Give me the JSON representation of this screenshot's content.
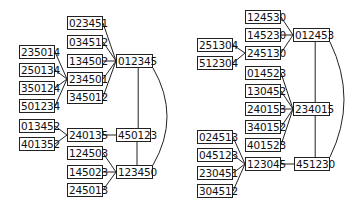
{
  "graphs": [
    {
      "name": "left-graph",
      "nodes": [
        {
          "id": "023451",
          "x": 67,
          "y": 16,
          "w": 36
        },
        {
          "id": "034512",
          "x": 67,
          "y": 35,
          "w": 36
        },
        {
          "id": "134502",
          "x": 67,
          "y": 54,
          "w": 36
        },
        {
          "id": "012345",
          "x": 116,
          "y": 54,
          "w": 37
        },
        {
          "id": "235014",
          "x": 19,
          "y": 45,
          "w": 36
        },
        {
          "id": "250134",
          "x": 19,
          "y": 63,
          "w": 36
        },
        {
          "id": "350124",
          "x": 19,
          "y": 81,
          "w": 36
        },
        {
          "id": "501234",
          "x": 19,
          "y": 99,
          "w": 36
        },
        {
          "id": "234501",
          "x": 67,
          "y": 72,
          "w": 36
        },
        {
          "id": "345012",
          "x": 67,
          "y": 90,
          "w": 36
        },
        {
          "id": "013452",
          "x": 19,
          "y": 119,
          "w": 36
        },
        {
          "id": "401352",
          "x": 19,
          "y": 137,
          "w": 36
        },
        {
          "id": "240135",
          "x": 67,
          "y": 128,
          "w": 36
        },
        {
          "id": "450123",
          "x": 116,
          "y": 128,
          "w": 35
        },
        {
          "id": "124503",
          "x": 67,
          "y": 146,
          "w": 36
        },
        {
          "id": "145023",
          "x": 67,
          "y": 165,
          "w": 36
        },
        {
          "id": "123450",
          "x": 116,
          "y": 165,
          "w": 37
        },
        {
          "id": "245013",
          "x": 67,
          "y": 183,
          "w": 36
        }
      ],
      "edges": [
        [
          "023451",
          "012345"
        ],
        [
          "034512",
          "012345"
        ],
        [
          "134502",
          "012345"
        ],
        [
          "234501",
          "012345"
        ],
        [
          "345012",
          "012345"
        ],
        [
          "235014",
          "234501"
        ],
        [
          "250134",
          "234501"
        ],
        [
          "350124",
          "234501"
        ],
        [
          "501234",
          "234501"
        ],
        [
          "013452",
          "240135"
        ],
        [
          "401352",
          "240135"
        ],
        [
          "240135",
          "450123"
        ],
        [
          "012345",
          "450123"
        ],
        [
          "450123",
          "123450"
        ],
        [
          "124503",
          "123450"
        ],
        [
          "145023",
          "123450"
        ],
        [
          "245013",
          "123450"
        ]
      ],
      "arc": {
        "from": "012345",
        "to": "123450"
      }
    },
    {
      "name": "right-graph",
      "nodes": [
        {
          "id": "124530",
          "x": 245,
          "y": 10,
          "w": 36
        },
        {
          "id": "145230",
          "x": 245,
          "y": 28,
          "w": 36
        },
        {
          "id": "012453",
          "x": 293,
          "y": 28,
          "w": 37
        },
        {
          "id": "251304",
          "x": 197,
          "y": 38,
          "w": 36
        },
        {
          "id": "512304",
          "x": 197,
          "y": 56,
          "w": 36
        },
        {
          "id": "245130",
          "x": 245,
          "y": 46,
          "w": 36
        },
        {
          "id": "014523",
          "x": 245,
          "y": 66,
          "w": 36
        },
        {
          "id": "130452",
          "x": 245,
          "y": 84,
          "w": 36
        },
        {
          "id": "240153",
          "x": 245,
          "y": 102,
          "w": 36
        },
        {
          "id": "234015",
          "x": 293,
          "y": 102,
          "w": 37
        },
        {
          "id": "340152",
          "x": 245,
          "y": 120,
          "w": 36
        },
        {
          "id": "401523",
          "x": 245,
          "y": 138,
          "w": 36
        },
        {
          "id": "024513",
          "x": 197,
          "y": 130,
          "w": 36
        },
        {
          "id": "045123",
          "x": 197,
          "y": 148,
          "w": 36
        },
        {
          "id": "230451",
          "x": 197,
          "y": 166,
          "w": 36
        },
        {
          "id": "304512",
          "x": 197,
          "y": 184,
          "w": 36
        },
        {
          "id": "123045",
          "x": 245,
          "y": 157,
          "w": 36
        },
        {
          "id": "451230",
          "x": 294,
          "y": 157,
          "w": 36
        }
      ],
      "edges": [
        [
          "124530",
          "012453"
        ],
        [
          "145230",
          "012453"
        ],
        [
          "245130",
          "012453"
        ],
        [
          "251304",
          "245130"
        ],
        [
          "512304",
          "245130"
        ],
        [
          "014523",
          "234015"
        ],
        [
          "130452",
          "234015"
        ],
        [
          "240153",
          "234015"
        ],
        [
          "340152",
          "234015"
        ],
        [
          "401523",
          "234015"
        ],
        [
          "012453",
          "234015"
        ],
        [
          "234015",
          "451230"
        ],
        [
          "024513",
          "123045"
        ],
        [
          "045123",
          "123045"
        ],
        [
          "230451",
          "123045"
        ],
        [
          "304512",
          "123045"
        ],
        [
          "123045",
          "451230"
        ]
      ],
      "arc": {
        "from": "012453",
        "to": "451230"
      }
    }
  ]
}
